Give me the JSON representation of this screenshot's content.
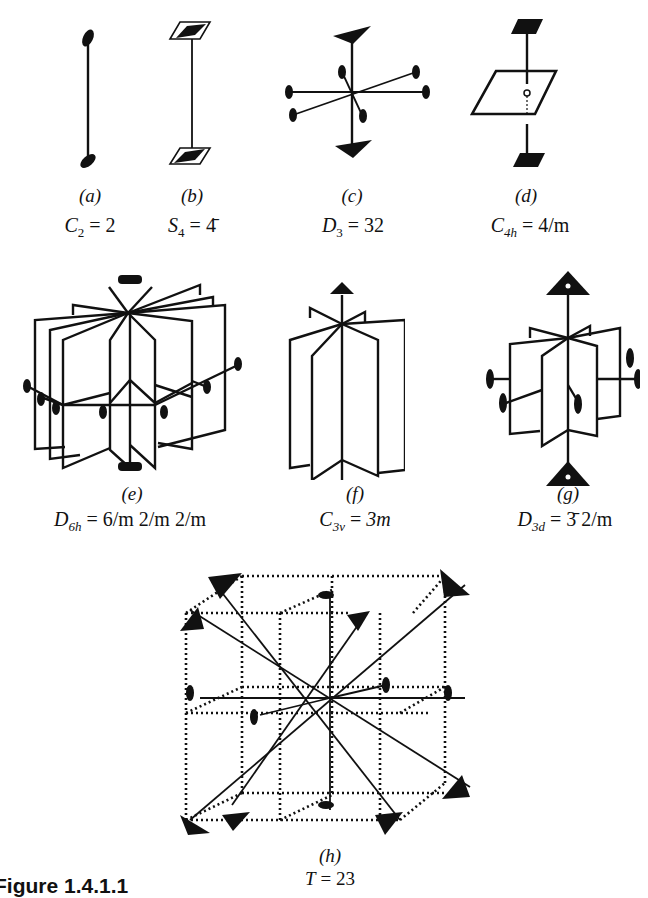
{
  "figure": {
    "caption_title": "Figure 1.4.1.1",
    "panels": [
      {
        "id": "a",
        "letter": "(a)",
        "symbol": "C",
        "subscript": "2",
        "equals": "=",
        "hm": "2",
        "description": "Two-fold rotation axis with lens-shaped symbols at each end"
      },
      {
        "id": "b",
        "letter": "(b)",
        "symbol": "S",
        "subscript": "4",
        "equals": "=",
        "hm": "4̄",
        "description": "Four-fold rotoinversion axis with parallelogram-lens symbols"
      },
      {
        "id": "c",
        "letter": "(c)",
        "symbol": "D",
        "subscript": "3",
        "equals": "=",
        "hm": "32",
        "description": "Three-fold axis with three perpendicular two-fold axes"
      },
      {
        "id": "d",
        "letter": "(d)",
        "symbol": "C",
        "subscript": "4h",
        "equals": "=",
        "hm": "4/m",
        "description": "Four-fold axis perpendicular to a mirror plane"
      },
      {
        "id": "e",
        "letter": "(e)",
        "symbol": "D",
        "subscript": "6h",
        "equals": "=",
        "hm": "6/m 2/m 2/m",
        "description": "Six-fold axis with six vertical mirror planes, horizontal mirror and two-fold axes"
      },
      {
        "id": "f",
        "letter": "(f)",
        "symbol": "C",
        "subscript": "3v",
        "equals": "=",
        "hm": "3m",
        "description": "Three-fold axis with three vertical mirror planes"
      },
      {
        "id": "g",
        "letter": "(g)",
        "symbol": "D",
        "subscript": "3d",
        "equals": "=",
        "hm": "3̄ 2/m",
        "description": "Three-fold rotoinversion axis with mirror planes and two-fold axes"
      },
      {
        "id": "h",
        "letter": "(h)",
        "symbol": "T",
        "subscript": "",
        "equals": "=",
        "hm": "23",
        "description": "Cubic frame with four three-fold axes along body diagonals and three two-fold axes"
      }
    ]
  },
  "colors": {
    "ink": "#111111",
    "background": "#ffffff"
  }
}
